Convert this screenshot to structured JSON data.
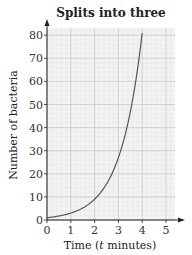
{
  "chart_data": {
    "type": "line",
    "title": "Splits into three",
    "xlabel": "Time (t minutes)",
    "ylabel": "Number of bacteria",
    "xlim": [
      0,
      5.3
    ],
    "ylim": [
      0,
      84
    ],
    "xticks": [
      0,
      1,
      2,
      3,
      4,
      5
    ],
    "yticks": [
      0,
      10,
      20,
      30,
      40,
      50,
      60,
      70,
      80
    ],
    "grid": true,
    "series": [
      {
        "name": "y = 3^t",
        "x": [
          0,
          0.5,
          1,
          1.5,
          2,
          2.5,
          3,
          3.5,
          4
        ],
        "values": [
          1,
          1.73,
          3,
          5.2,
          9,
          15.6,
          27,
          46.8,
          81
        ]
      }
    ],
    "colors": {
      "line": "#555555",
      "grid_major": "#c8c8c8",
      "grid_minor": "#e4e4e4",
      "background": "#f3f3f3",
      "axis": "#222222"
    }
  }
}
